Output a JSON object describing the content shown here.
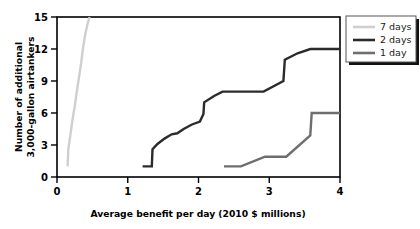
{
  "chart_data": {
    "type": "line",
    "title": "",
    "xlabel": "Average benefit per day (2010 $ millions)",
    "ylabel": "Number of additional 3,000-gallon airtankers",
    "xlim": [
      0,
      4
    ],
    "ylim": [
      0,
      15
    ],
    "xticks": [
      "0",
      "1",
      "2",
      "3",
      "4"
    ],
    "xtick_values": [
      0,
      1,
      2,
      3,
      4
    ],
    "yticks": [
      "0",
      "3",
      "6",
      "9",
      "12",
      "15"
    ],
    "ytick_values": [
      0,
      3,
      6,
      9,
      12,
      15
    ],
    "grid": false,
    "legend_position": "upper-right-outside",
    "series": [
      {
        "name": "7 days",
        "color": "#cfcfcf",
        "width": 2.4,
        "points": [
          [
            0.15,
            1.0
          ],
          [
            0.16,
            2.6
          ],
          [
            0.19,
            4.0
          ],
          [
            0.22,
            5.4
          ],
          [
            0.25,
            6.6
          ],
          [
            0.28,
            8.0
          ],
          [
            0.31,
            9.3
          ],
          [
            0.34,
            10.6
          ],
          [
            0.36,
            11.7
          ],
          [
            0.38,
            12.6
          ],
          [
            0.4,
            13.4
          ],
          [
            0.43,
            14.3
          ],
          [
            0.46,
            15.0
          ]
        ]
      },
      {
        "name": "2 days",
        "color": "#2b2b2b",
        "width": 2.4,
        "points": [
          [
            1.21,
            1.0
          ],
          [
            1.34,
            1.0
          ],
          [
            1.35,
            2.6
          ],
          [
            1.42,
            3.1
          ],
          [
            1.52,
            3.6
          ],
          [
            1.62,
            4.0
          ],
          [
            1.7,
            4.1
          ],
          [
            1.79,
            4.5
          ],
          [
            1.9,
            4.9
          ],
          [
            2.02,
            5.2
          ],
          [
            2.07,
            5.9
          ],
          [
            2.08,
            7.0
          ],
          [
            2.22,
            7.6
          ],
          [
            2.34,
            8.0
          ],
          [
            2.92,
            8.0
          ],
          [
            3.2,
            9.0
          ],
          [
            3.22,
            11.0
          ],
          [
            3.4,
            11.6
          ],
          [
            3.58,
            12.0
          ],
          [
            4.0,
            12.0
          ]
        ]
      },
      {
        "name": "1 day",
        "color": "#6e6e6e",
        "width": 2.4,
        "points": [
          [
            2.36,
            1.0
          ],
          [
            2.6,
            1.0
          ],
          [
            2.94,
            1.9
          ],
          [
            3.24,
            1.9
          ],
          [
            3.58,
            3.9
          ],
          [
            3.6,
            6.0
          ],
          [
            4.0,
            6.0
          ]
        ]
      }
    ],
    "legend": [
      {
        "label": "7 days",
        "color": "#cfcfcf"
      },
      {
        "label": "2 days",
        "color": "#2b2b2b"
      },
      {
        "label": "1 day",
        "color": "#6e6e6e"
      }
    ]
  }
}
